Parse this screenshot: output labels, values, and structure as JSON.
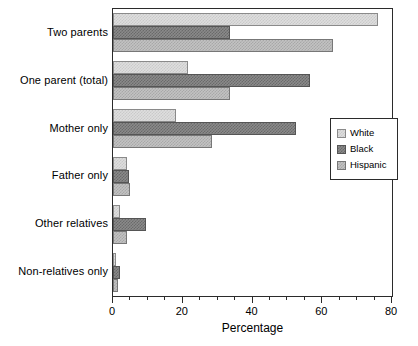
{
  "chart_data": {
    "type": "bar",
    "orientation": "horizontal",
    "title": "",
    "xlabel": "Percentage",
    "ylabel": "",
    "xlim": [
      0,
      80
    ],
    "xticks": [
      0,
      20,
      40,
      60,
      80
    ],
    "xtick_labels": [
      "0",
      "20",
      "40",
      "60",
      "80"
    ],
    "minor_tick_interval": 5,
    "grid": false,
    "legend_position": "center right",
    "categories": [
      "Two parents",
      "One parent (total)",
      "Mother only",
      "Father only",
      "Other relatives",
      "Non-relatives only"
    ],
    "series": [
      {
        "name": "White",
        "color": "#dedede",
        "values": [
          76.0,
          21.4,
          18.0,
          4.0,
          2.0,
          1.0
        ]
      },
      {
        "name": "Black",
        "color": "#8a8a8a",
        "values": [
          33.5,
          56.5,
          52.5,
          4.5,
          9.5,
          2.0
        ]
      },
      {
        "name": "Hispanic",
        "color": "#c2c2c2",
        "values": [
          63.0,
          33.5,
          28.5,
          5.0,
          4.0,
          1.5
        ]
      }
    ]
  },
  "axis": {
    "x_title": "Percentage"
  },
  "legend": {
    "entries": [
      {
        "label": "White"
      },
      {
        "label": "Black"
      },
      {
        "label": "Hispanic"
      }
    ]
  }
}
